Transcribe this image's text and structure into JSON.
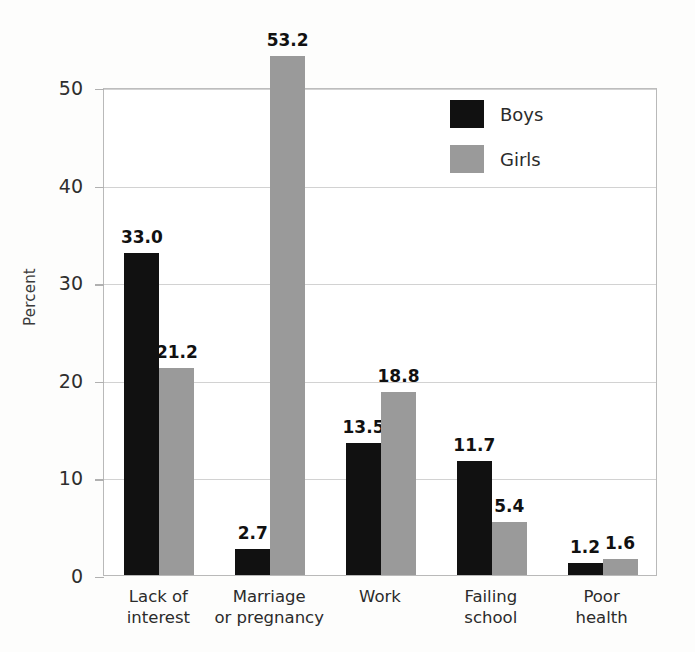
{
  "chart_data": {
    "type": "bar",
    "title": "",
    "subtitle": "",
    "xlabel": "",
    "ylabel": "Percent",
    "ylim": [
      0,
      50
    ],
    "ytick_step": 10,
    "yticks": [
      0,
      10,
      20,
      30,
      40,
      50
    ],
    "ytick_labels": [
      "0",
      "10",
      "20",
      "30",
      "40",
      "50"
    ],
    "grid": true,
    "grid_axis": "y",
    "legend_position": "upper right inside",
    "categories": [
      "Lack of\ninterest",
      "Marriage\nor pregnancy",
      "Work",
      "Failing\nschool",
      "Poor\nhealth"
    ],
    "category_lines": [
      [
        "Lack of",
        "interest"
      ],
      [
        "Marriage",
        "or pregnancy"
      ],
      [
        "Work",
        ""
      ],
      [
        "Failing",
        "school"
      ],
      [
        "Poor",
        "health"
      ]
    ],
    "series": [
      {
        "name": "Boys",
        "color": "#111111",
        "values": [
          33.0,
          2.7,
          13.5,
          11.7,
          1.2
        ],
        "value_labels": [
          "33.0",
          "2.7",
          "13.5",
          "11.7",
          "1.2"
        ]
      },
      {
        "name": "Girls",
        "color": "#9a9a9a",
        "values": [
          21.2,
          53.2,
          18.8,
          5.4,
          1.6
        ],
        "value_labels": [
          "21.2",
          "53.2",
          "18.8",
          "5.4",
          "1.6"
        ]
      }
    ],
    "annotations": []
  },
  "legend": {
    "entries": [
      {
        "label": "Boys",
        "swatch": "black-swatch"
      },
      {
        "label": "Girls",
        "swatch": "gray-swatch"
      }
    ]
  },
  "axes": {
    "y_title": "Percent"
  },
  "colors": {
    "boys": "#111111",
    "girls": "#9a9a9a",
    "frame": "#b9b9b9",
    "grid": "#d2d2d2",
    "background": "#fdfdfc"
  }
}
